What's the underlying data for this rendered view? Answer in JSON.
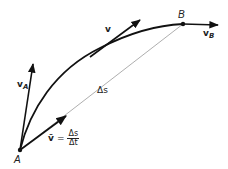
{
  "diagram": {
    "points": [
      {
        "id": "A",
        "label": "A",
        "x": 20,
        "y": 150
      },
      {
        "id": "B",
        "label": "B",
        "x": 183,
        "y": 24
      }
    ],
    "vectors": [
      {
        "id": "vA",
        "label": "v",
        "subscript": "A",
        "from": [
          20,
          150
        ],
        "to": [
          33,
          63
        ]
      },
      {
        "id": "v",
        "label": "v",
        "from": [
          92,
          58
        ],
        "to": [
          140,
          20
        ]
      },
      {
        "id": "vB",
        "label": "v",
        "subscript": "B",
        "from": [
          183,
          24
        ],
        "to": [
          218,
          25
        ]
      },
      {
        "id": "chord",
        "label": "Δs",
        "from": [
          20,
          150
        ],
        "to": [
          183,
          24
        ]
      }
    ],
    "equation": {
      "lhs": "v̄",
      "eq": "=",
      "numerator": "Δs",
      "denominator": "Δt"
    },
    "colors": {
      "stroke": "#111111",
      "chord": "#999999",
      "background": "#ffffff"
    }
  }
}
